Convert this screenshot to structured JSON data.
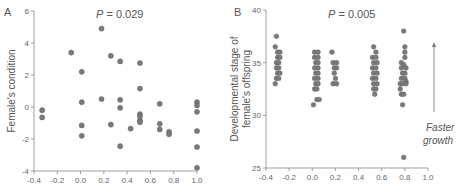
{
  "chart_data": [
    {
      "type": "scatter",
      "panel_label": "A",
      "title": "",
      "annotation_p": "P = 0.029",
      "p_italic": "P",
      "p_value": "= 0.029",
      "xlabel": "",
      "ylabel": "Female's condition",
      "xlim": [
        -0.4,
        1.0
      ],
      "ylim": [
        -4,
        6
      ],
      "x_ticks": [
        -0.4,
        -0.2,
        0.0,
        0.2,
        0.4,
        0.6,
        0.8,
        1.0
      ],
      "x_tick_labels": [
        "-0.4",
        "-0.2",
        "0.0",
        "0.2",
        "0.4",
        "0.6",
        "0.8",
        "1.0"
      ],
      "y_ticks": [
        -4,
        -2,
        0,
        2,
        4,
        6
      ],
      "y_tick_labels": [
        "-4",
        "-2",
        "0",
        "2",
        "4",
        "6"
      ],
      "grid": false,
      "points": [
        [
          -0.33,
          -0.2
        ],
        [
          -0.33,
          -0.65
        ],
        [
          -0.08,
          3.4
        ],
        [
          0.01,
          2.2
        ],
        [
          0.01,
          0.3
        ],
        [
          0.01,
          -1.15
        ],
        [
          0.01,
          -1.8
        ],
        [
          0.18,
          4.9
        ],
        [
          0.18,
          0.5
        ],
        [
          0.26,
          3.2
        ],
        [
          0.26,
          -1.1
        ],
        [
          0.34,
          2.85
        ],
        [
          0.34,
          0.45
        ],
        [
          0.34,
          -0.05
        ],
        [
          0.34,
          -2.45
        ],
        [
          0.43,
          -1.35
        ],
        [
          0.51,
          2.75
        ],
        [
          0.51,
          1.15
        ],
        [
          0.51,
          -0.45
        ],
        [
          0.51,
          -0.6
        ],
        [
          0.51,
          -0.85
        ],
        [
          0.51,
          -0.95
        ],
        [
          0.68,
          0.2
        ],
        [
          0.68,
          -1.05
        ],
        [
          0.68,
          -1.4
        ],
        [
          0.76,
          -1.55
        ],
        [
          0.76,
          -1.7
        ],
        [
          1.0,
          0.3
        ],
        [
          1.0,
          0.1
        ],
        [
          1.0,
          -0.3
        ],
        [
          1.0,
          -1.5
        ],
        [
          1.0,
          -2.5
        ],
        [
          1.0,
          -3.8
        ]
      ]
    },
    {
      "type": "scatter",
      "panel_label": "B",
      "title": "",
      "annotation_p": "P = 0.005",
      "p_italic": "P",
      "p_value": "= 0.005",
      "xlabel": "",
      "ylabel_line1": "Developmental stage of",
      "ylabel_line2": "female's offspring",
      "ylabel": "Developmental stage of female's offspring",
      "xlim": [
        -0.4,
        1.0
      ],
      "ylim": [
        25,
        40
      ],
      "x_ticks": [
        -0.4,
        -0.2,
        0.0,
        0.2,
        0.4,
        0.6,
        0.8,
        1.0
      ],
      "x_tick_labels": [
        "-0.4",
        "-0.2",
        "0.0",
        "0.2",
        "0.4",
        "0.6",
        "0.8",
        "1.0"
      ],
      "y_ticks": [
        25,
        30,
        35,
        40
      ],
      "y_tick_labels": [
        "25",
        "30",
        "35",
        "40"
      ],
      "grid": false,
      "arrow_annotation_line1": "Faster",
      "arrow_annotation_line2": "growth",
      "points": [
        [
          -0.31,
          37.5
        ],
        [
          -0.32,
          36.5
        ],
        [
          -0.3,
          36.0
        ],
        [
          -0.28,
          36.0
        ],
        [
          -0.3,
          35.5
        ],
        [
          -0.28,
          35.5
        ],
        [
          -0.31,
          35.0
        ],
        [
          -0.29,
          35.0
        ],
        [
          -0.31,
          34.5
        ],
        [
          -0.29,
          34.5
        ],
        [
          -0.3,
          34.0
        ],
        [
          -0.28,
          34.0
        ],
        [
          -0.31,
          33.5
        ],
        [
          -0.29,
          33.5
        ],
        [
          -0.32,
          33.0
        ],
        [
          0.02,
          36.0
        ],
        [
          0.05,
          36.0
        ],
        [
          0.02,
          35.5
        ],
        [
          0.05,
          35.5
        ],
        [
          0.03,
          35.0
        ],
        [
          0.05,
          35.0
        ],
        [
          0.02,
          34.5
        ],
        [
          0.05,
          34.5
        ],
        [
          0.03,
          34.0
        ],
        [
          0.05,
          34.0
        ],
        [
          0.02,
          33.5
        ],
        [
          0.05,
          33.5
        ],
        [
          0.03,
          33.0
        ],
        [
          0.05,
          33.0
        ],
        [
          0.02,
          32.5
        ],
        [
          0.04,
          32.5
        ],
        [
          0.04,
          31.5
        ],
        [
          0.06,
          31.5
        ],
        [
          0.01,
          31.0
        ],
        [
          0.17,
          36.0
        ],
        [
          0.18,
          35.0
        ],
        [
          0.21,
          35.0
        ],
        [
          0.19,
          34.5
        ],
        [
          0.21,
          34.5
        ],
        [
          0.19,
          34.0
        ],
        [
          0.2,
          33.5
        ],
        [
          0.18,
          33.0
        ],
        [
          0.21,
          33.0
        ],
        [
          0.53,
          36.5
        ],
        [
          0.55,
          36.0
        ],
        [
          0.52,
          35.5
        ],
        [
          0.55,
          35.5
        ],
        [
          0.53,
          35.0
        ],
        [
          0.56,
          35.0
        ],
        [
          0.52,
          34.5
        ],
        [
          0.55,
          34.5
        ],
        [
          0.53,
          34.0
        ],
        [
          0.56,
          34.0
        ],
        [
          0.52,
          33.5
        ],
        [
          0.55,
          33.5
        ],
        [
          0.53,
          33.0
        ],
        [
          0.56,
          33.0
        ],
        [
          0.53,
          32.5
        ],
        [
          0.55,
          32.5
        ],
        [
          0.54,
          32.0
        ],
        [
          0.79,
          38.0
        ],
        [
          0.8,
          36.5
        ],
        [
          0.8,
          36.0
        ],
        [
          0.77,
          35.0
        ],
        [
          0.8,
          35.5
        ],
        [
          0.79,
          34.8
        ],
        [
          0.77,
          34.5
        ],
        [
          0.81,
          34.5
        ],
        [
          0.78,
          34.0
        ],
        [
          0.8,
          34.0
        ],
        [
          0.77,
          33.5
        ],
        [
          0.8,
          33.5
        ],
        [
          0.81,
          33.2
        ],
        [
          0.76,
          33.0
        ],
        [
          0.78,
          33.0
        ],
        [
          0.81,
          33.0
        ],
        [
          0.76,
          32.5
        ],
        [
          0.77,
          32.0
        ],
        [
          0.79,
          32.0
        ],
        [
          0.78,
          31.0
        ],
        [
          0.79,
          26.0
        ]
      ]
    }
  ]
}
